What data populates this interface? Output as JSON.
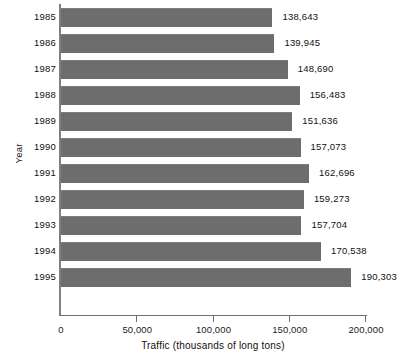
{
  "chart_data": {
    "type": "bar",
    "orientation": "horizontal",
    "title": "",
    "xlabel": "Traffic (thousands of long tons)",
    "ylabel": "Year",
    "categories": [
      "1985",
      "1986",
      "1987",
      "1988",
      "1989",
      "1990",
      "1991",
      "1992",
      "1993",
      "1994",
      "1995"
    ],
    "values": [
      138643,
      139945,
      148690,
      156483,
      151636,
      157073,
      162696,
      159273,
      157704,
      170538,
      190303
    ],
    "value_labels": [
      "138,643",
      "139,945",
      "148,690",
      "156,483",
      "151,636",
      "157,073",
      "162,696",
      "159,273",
      "157,704",
      "170,538",
      "190,303"
    ],
    "xlim": [
      0,
      200000
    ],
    "xticks": [
      0,
      50000,
      100000,
      150000,
      200000
    ],
    "xtick_labels": [
      "0",
      "50,000",
      "100,000",
      "150,000",
      "200,000"
    ],
    "grid": false,
    "legend": null,
    "bar_color": "#6d6d6d",
    "axis_color": "#808080",
    "text_color": "#111111"
  }
}
